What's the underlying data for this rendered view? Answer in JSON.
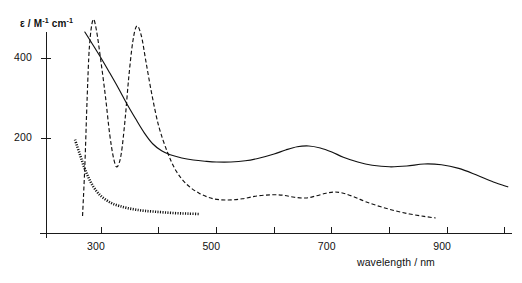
{
  "figure": {
    "width": 522,
    "height": 283,
    "background": "#ffffff",
    "ink_color": "#111111"
  },
  "axes": {
    "y_title_parts": {
      "epsilon": "ε",
      "slash": " / M",
      "exp1": "-1",
      "unit": " cm",
      "exp2": "-1"
    },
    "y_title_plain": "ε / M-1 cm-1",
    "x_title": "wavelength / nm",
    "y_ticks": [
      {
        "value": 200,
        "label": "200"
      },
      {
        "value": 400,
        "label": "400"
      }
    ],
    "x_ticks": [
      {
        "value": 300,
        "label": "300"
      },
      {
        "value": 400,
        "label": ""
      },
      {
        "value": 500,
        "label": "500"
      },
      {
        "value": 600,
        "label": ""
      },
      {
        "value": 700,
        "label": "700"
      },
      {
        "value": 800,
        "label": ""
      },
      {
        "value": 900,
        "label": "900"
      },
      {
        "value": 1000,
        "label": ""
      }
    ]
  },
  "chart_data": {
    "type": "line",
    "title": "",
    "xlabel": "wavelength / nm",
    "ylabel": "ε / M-1 cm-1",
    "xlim": [
      220,
      1010
    ],
    "ylim": [
      -38,
      505
    ],
    "grid": false,
    "legend": "none",
    "series": [
      {
        "name": "solid-spectrum",
        "style": "solid",
        "points": [
          [
            272,
            465
          ],
          [
            285,
            435
          ],
          [
            300,
            400
          ],
          [
            315,
            363
          ],
          [
            330,
            325
          ],
          [
            345,
            285
          ],
          [
            360,
            248
          ],
          [
            375,
            213
          ],
          [
            390,
            185
          ],
          [
            405,
            168
          ],
          [
            420,
            158
          ],
          [
            440,
            150
          ],
          [
            460,
            145
          ],
          [
            480,
            142
          ],
          [
            500,
            140
          ],
          [
            525,
            140
          ],
          [
            550,
            143
          ],
          [
            575,
            150
          ],
          [
            600,
            160
          ],
          [
            620,
            170
          ],
          [
            640,
            178
          ],
          [
            660,
            180
          ],
          [
            680,
            175
          ],
          [
            700,
            165
          ],
          [
            720,
            152
          ],
          [
            745,
            140
          ],
          [
            770,
            132
          ],
          [
            800,
            128
          ],
          [
            830,
            130
          ],
          [
            860,
            135
          ],
          [
            890,
            133
          ],
          [
            920,
            124
          ],
          [
            950,
            108
          ],
          [
            980,
            90
          ],
          [
            1005,
            78
          ]
        ]
      },
      {
        "name": "dashed-spectrum",
        "style": "dashed",
        "points": [
          [
            268,
            5
          ],
          [
            272,
            130
          ],
          [
            276,
            300
          ],
          [
            280,
            430
          ],
          [
            286,
            495
          ],
          [
            292,
            470
          ],
          [
            300,
            390
          ],
          [
            308,
            300
          ],
          [
            315,
            210
          ],
          [
            322,
            148
          ],
          [
            328,
            128
          ],
          [
            335,
            160
          ],
          [
            342,
            250
          ],
          [
            348,
            350
          ],
          [
            355,
            440
          ],
          [
            362,
            480
          ],
          [
            370,
            455
          ],
          [
            378,
            390
          ],
          [
            388,
            310
          ],
          [
            400,
            230
          ],
          [
            415,
            165
          ],
          [
            430,
            118
          ],
          [
            448,
            85
          ],
          [
            470,
            62
          ],
          [
            495,
            48
          ],
          [
            520,
            45
          ],
          [
            545,
            48
          ],
          [
            570,
            55
          ],
          [
            595,
            58
          ],
          [
            615,
            57
          ],
          [
            635,
            52
          ],
          [
            655,
            50
          ],
          [
            672,
            55
          ],
          [
            690,
            62
          ],
          [
            705,
            65
          ],
          [
            720,
            62
          ],
          [
            740,
            52
          ],
          [
            760,
            40
          ],
          [
            785,
            28
          ],
          [
            810,
            18
          ],
          [
            835,
            10
          ],
          [
            860,
            4
          ],
          [
            880,
            0
          ]
        ]
      },
      {
        "name": "dotted-spectrum",
        "style": "dotted",
        "points": [
          [
            255,
            196
          ],
          [
            258,
            182
          ],
          [
            262,
            165
          ],
          [
            266,
            148
          ],
          [
            270,
            130
          ],
          [
            275,
            112
          ],
          [
            280,
            96
          ],
          [
            286,
            80
          ],
          [
            293,
            66
          ],
          [
            300,
            55
          ],
          [
            310,
            44
          ],
          [
            320,
            36
          ],
          [
            332,
            30
          ],
          [
            345,
            25
          ],
          [
            360,
            21
          ],
          [
            375,
            18
          ],
          [
            392,
            16
          ],
          [
            410,
            14
          ],
          [
            430,
            12
          ],
          [
            450,
            11
          ],
          [
            470,
            10
          ]
        ]
      }
    ]
  }
}
